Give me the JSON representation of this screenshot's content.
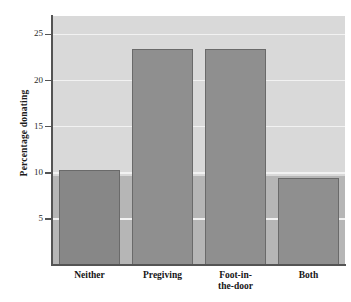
{
  "chart_data": {
    "type": "bar",
    "title": "",
    "subtitle": "",
    "xlabel": "",
    "ylabel": "Percentage donating",
    "categories": [
      "Neither",
      "Pregiving",
      "Foot-in-the-door",
      "Both"
    ],
    "category_lines": [
      [
        "Neither"
      ],
      [
        "Pregiving"
      ],
      [
        "Foot-in-",
        "the-door"
      ],
      [
        "Both"
      ]
    ],
    "values": [
      10.3,
      23.4,
      23.4,
      9.4
    ],
    "ylim": [
      0,
      27
    ],
    "yticks": [
      5,
      10,
      15,
      20,
      25
    ],
    "ytick_labels": [
      "5",
      "10",
      "15",
      "20",
      "25"
    ],
    "grid": true,
    "grid_axis": "y",
    "legend": null,
    "annotations": [],
    "colors": {
      "bar_fill": "#8f8f8f",
      "bar_fill_first": "#878787",
      "bar_edge": "#6a6a6a",
      "plot_bg_upper": "#d9d9d9",
      "plot_bg_lower": "#b6b6b6",
      "gridline": "#f2f2f2",
      "axis": "#545454",
      "text": "#161616",
      "page_bg": "#ffffff"
    }
  }
}
